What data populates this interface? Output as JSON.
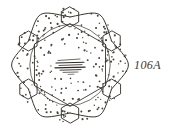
{
  "plate": {
    "label": "106A",
    "caption_text": "106A",
    "ink_color": "#3a362f",
    "stipple_color": "#4a453d",
    "background_color": "#ffffff",
    "center_mark": "illegible-handwritten-inscription"
  },
  "figure": {
    "type": "ornamental-plan-drawing",
    "symmetry_order": 6,
    "center": {
      "x": 70,
      "y": 65
    },
    "outer_stipple_radius": 57,
    "petal_count": 6,
    "node_count": 6,
    "node_shape": "hexagon",
    "node_radius": 10,
    "node_ring_radius": 48,
    "inner_hex_radius": 41,
    "petal_bulge": 15,
    "stipple_dot_count": 232,
    "stipple_dot_radius": 0.85
  },
  "center_scribble": {
    "stroke_count": 7,
    "lines": [
      {
        "x1": 58,
        "y1": 60.5,
        "x2": 80,
        "y2": 59.0,
        "w": 0.7
      },
      {
        "x1": 56,
        "y1": 63.0,
        "x2": 84,
        "y2": 62.2,
        "w": 1.1
      },
      {
        "x1": 59,
        "y1": 65.5,
        "x2": 82,
        "y2": 64.6,
        "w": 0.8
      },
      {
        "x1": 55,
        "y1": 67.8,
        "x2": 85,
        "y2": 67.2,
        "w": 1.3
      },
      {
        "x1": 60,
        "y1": 70.2,
        "x2": 81,
        "y2": 69.6,
        "w": 0.9
      },
      {
        "x1": 63,
        "y1": 72.4,
        "x2": 78,
        "y2": 72.0,
        "w": 0.7
      },
      {
        "x1": 68,
        "y1": 74.4,
        "x2": 74,
        "y2": 74.2,
        "w": 0.6
      }
    ]
  }
}
